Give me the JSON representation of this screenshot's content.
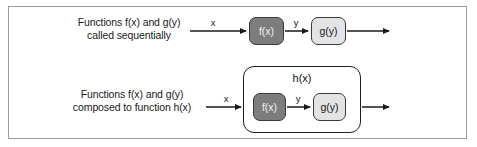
{
  "figure": {
    "rows": [
      {
        "id": "sequential",
        "caption_lines": [
          "Functions f(x) and g(y)",
          "called sequentially"
        ],
        "input_label": "x",
        "middle_label": "y",
        "nodes": [
          {
            "id": "fx",
            "label": "f(x)",
            "style": "dark"
          },
          {
            "id": "gy",
            "label": "g(y)",
            "style": "light"
          }
        ]
      },
      {
        "id": "composed",
        "caption_lines": [
          "Functions f(x) and g(y)",
          "composed to function h(x)"
        ],
        "input_label": "x",
        "middle_label": "y",
        "container_label": "h(x)",
        "nodes": [
          {
            "id": "fx",
            "label": "f(x)",
            "style": "dark"
          },
          {
            "id": "gy",
            "label": "g(y)",
            "style": "light"
          }
        ]
      }
    ],
    "colors": {
      "frame_border": "#9b9b9b",
      "node_dark_fill": "#7d7d7d",
      "node_dark_text": "#f2f2f2",
      "node_light_fill": "#e3e3e3",
      "node_light_text": "#1a1a1a",
      "node_border": "#3a3a3a",
      "container_border": "#1f1f1f",
      "arrow": "#1a1a1a",
      "background": "#ffffff",
      "text": "#1a1a1a"
    }
  }
}
